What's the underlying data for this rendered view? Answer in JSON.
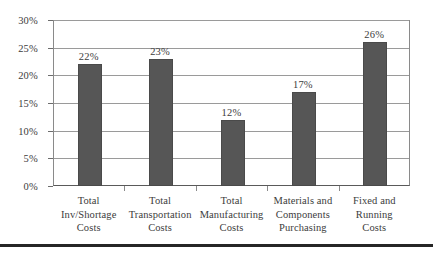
{
  "chart_data": {
    "type": "bar",
    "title": "",
    "subtitle": "",
    "xlabel": "",
    "ylabel": "",
    "ylim": [
      0,
      30
    ],
    "ytick_values": [
      0,
      5,
      10,
      15,
      20,
      25,
      30
    ],
    "ytick_labels": [
      "0%",
      "5%",
      "10%",
      "15%",
      "20%",
      "25%",
      "30%"
    ],
    "grid": true,
    "legend": false,
    "legend_position": "none",
    "value_labels": [
      "22%",
      "23%",
      "12%",
      "17%",
      "26%"
    ],
    "categories": [
      "Total Inv/Shortage Costs",
      "Total Transportation Costs",
      "Total Manufacturing Costs",
      "Materials and Components Purchasing",
      "Fixed and Running Costs"
    ],
    "category_lines": [
      [
        "Total",
        "Inv/Shortage",
        "Costs"
      ],
      [
        "Total",
        "Transportation",
        "Costs"
      ],
      [
        "Total",
        "Manufacturing",
        "Costs"
      ],
      [
        "Materials and",
        "Components",
        "Purchasing"
      ],
      [
        "Fixed and",
        "Running",
        "Costs"
      ]
    ],
    "values": [
      22,
      23,
      12,
      17,
      26
    ],
    "series": [
      {
        "name": "Percent of total cost",
        "values": [
          22,
          23,
          12,
          17,
          26
        ]
      }
    ],
    "colors": {
      "bar_fill": "#565656",
      "bar_border": "#4a4a4a",
      "gridline": "#9a9a9a",
      "axis": "#8a8a8a",
      "text": "#3c3c3c",
      "background": "#ffffff",
      "bottom_rule": "#262626"
    }
  }
}
